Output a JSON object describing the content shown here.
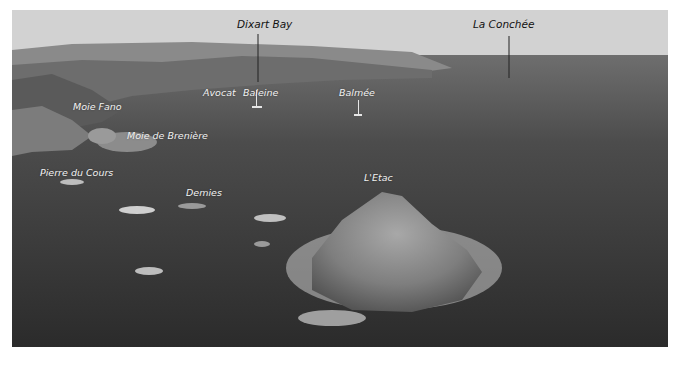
{
  "photo": {
    "description": "Aerial greyscale photograph of sea with rocky islets and coastline",
    "labels": [
      {
        "id": "dixart-bay",
        "text": "Dixart Bay",
        "x": 237,
        "y": 18,
        "dark": true
      },
      {
        "id": "la-conchee",
        "text": "La Conchée",
        "x": 472,
        "y": 18,
        "dark": true
      },
      {
        "id": "avocat",
        "text": "Avocat",
        "x": 203,
        "y": 87
      },
      {
        "id": "baleine",
        "text": "Baleine",
        "x": 243,
        "y": 87
      },
      {
        "id": "balmee",
        "text": "Balmée",
        "x": 339,
        "y": 87
      },
      {
        "id": "moie-fano",
        "text": "Moie Fano",
        "x": 73,
        "y": 101
      },
      {
        "id": "moie-de-breniere",
        "text": "Moie de Brenière",
        "x": 127,
        "y": 130
      },
      {
        "id": "pierre-du-cours",
        "text": "Pierre du Cours",
        "x": 40,
        "y": 167
      },
      {
        "id": "demies",
        "text": "Demies",
        "x": 186,
        "y": 187
      },
      {
        "id": "letac",
        "text": "L'Etac",
        "x": 364,
        "y": 172
      }
    ]
  }
}
